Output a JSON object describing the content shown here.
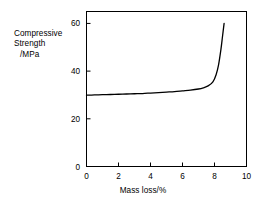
{
  "chart_data": {
    "type": "line",
    "title": "",
    "xlabel": "Mass loss/%",
    "ylabel": "Compressive Strength /MPa",
    "ylabel_lines": [
      "Compressive",
      "Strength",
      "/MPa"
    ],
    "xlim": [
      0,
      10
    ],
    "ylim": [
      0,
      65
    ],
    "xticks": [
      0,
      2,
      4,
      6,
      8,
      10
    ],
    "xtick_labels": [
      "0",
      "2",
      "4",
      "6",
      "8",
      "10"
    ],
    "yticks": [
      0,
      20,
      40,
      60
    ],
    "ytick_labels": [
      "0",
      "20",
      "40",
      "60"
    ],
    "grid": false,
    "legend": false,
    "frame": "box",
    "line_color": "#000000",
    "line_width": 1.3,
    "series": [
      {
        "name": "Compressive strength vs mass loss",
        "x": [
          0.0,
          0.5,
          1.0,
          1.5,
          2.0,
          2.5,
          3.0,
          3.5,
          4.0,
          4.5,
          5.0,
          5.5,
          6.0,
          6.5,
          7.0,
          7.3,
          7.6,
          7.9,
          8.1,
          8.25,
          8.4,
          8.5,
          8.6
        ],
        "y": [
          29.9,
          30.0,
          30.1,
          30.2,
          30.3,
          30.4,
          30.5,
          30.6,
          30.8,
          31.0,
          31.2,
          31.4,
          31.7,
          32.0,
          32.5,
          33.0,
          33.8,
          35.5,
          38.5,
          42.5,
          49.0,
          54.5,
          60.0
        ]
      }
    ],
    "annotations": []
  },
  "axis_captions": {
    "y_line1": "Compressive",
    "y_line2": "Strength",
    "y_line3": "/MPa",
    "x": "Mass loss/%"
  }
}
